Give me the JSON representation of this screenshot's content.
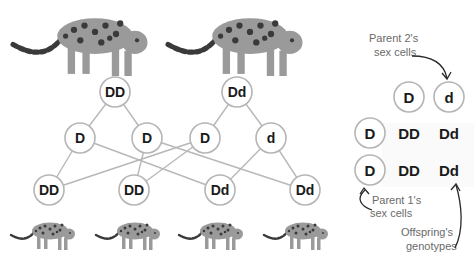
{
  "tree": {
    "parents": [
      {
        "id": "p1",
        "genotype": "DD"
      },
      {
        "id": "p2",
        "genotype": "Dd"
      }
    ],
    "gametes": [
      {
        "id": "g1",
        "allele": "D",
        "parent": "p1"
      },
      {
        "id": "g2",
        "allele": "D",
        "parent": "p1"
      },
      {
        "id": "g3",
        "allele": "D",
        "parent": "p2"
      },
      {
        "id": "g4",
        "allele": "d",
        "parent": "p2"
      }
    ],
    "offspring": [
      {
        "id": "o1",
        "genotype": "DD",
        "from": [
          "g1",
          "g3"
        ]
      },
      {
        "id": "o2",
        "genotype": "DD",
        "from": [
          "g2",
          "g3"
        ]
      },
      {
        "id": "o3",
        "genotype": "Dd",
        "from": [
          "g1",
          "g4"
        ]
      },
      {
        "id": "o4",
        "genotype": "Dd",
        "from": [
          "g2",
          "g4"
        ]
      }
    ]
  },
  "punnett": {
    "parent2_alleles": [
      "D",
      "d"
    ],
    "parent1_alleles": [
      "D",
      "D"
    ],
    "cells": [
      [
        "DD",
        "Dd"
      ],
      [
        "DD",
        "Dd"
      ]
    ]
  },
  "annotations": {
    "parent2_line1": "Parent 2's",
    "parent2_line2": "sex cells",
    "parent1_line1": "Parent 1's",
    "parent1_line2": "sex cells",
    "offspring_line1": "Offspring's",
    "offspring_line2": "genotypes"
  },
  "images": {
    "parent_animals": [
      "jaguar-parent-1",
      "jaguar-parent-2"
    ],
    "offspring_animals": [
      "jaguar-cub-1",
      "jaguar-cub-2",
      "jaguar-cub-3",
      "jaguar-cub-4"
    ]
  }
}
